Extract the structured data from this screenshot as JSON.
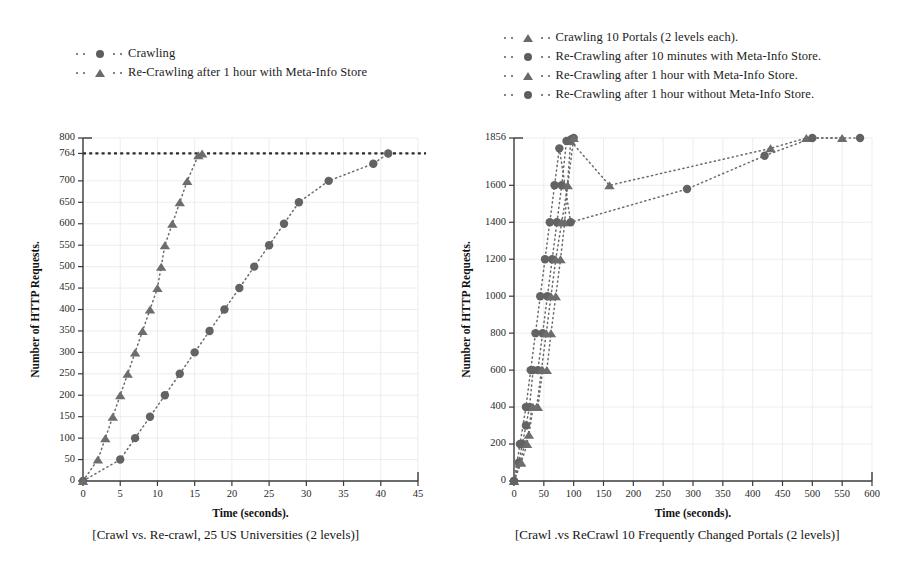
{
  "figure": {
    "panels": [
      {
        "id": "left",
        "caption": "[Crawl vs. Re-crawl, 25 US Universities (2 levels)]",
        "legend": [
          {
            "label": "Crawling",
            "marker": "circle-marker-icon"
          },
          {
            "label": "Re-Crawling after 1 hour with Meta-Info Store",
            "marker": "triangle-marker-icon"
          }
        ]
      },
      {
        "id": "right",
        "caption": "[Crawl .vs ReCrawl 10 Frequently Changed Portals (2 levels)]",
        "legend": [
          {
            "label": "Crawling 10 Portals (2 levels each).",
            "marker": "triangle-marker-icon"
          },
          {
            "label": "Re-Crawling after 10 minutes with Meta-Info Store.",
            "marker": "circle-marker-icon"
          },
          {
            "label": "Re-Crawling after 1 hour with Meta-Info Store.",
            "marker": "triangle-marker-icon"
          },
          {
            "label": "Re-Crawling after 1 hour without Meta-Info Store.",
            "marker": "circle-marker-icon"
          }
        ]
      }
    ]
  },
  "colors": {
    "marker": "#636363",
    "line": "#6b6b6b",
    "axis": "#3a3a3a",
    "reference": "#2b2b2b",
    "grid": "#e9e9e9",
    "text": "#1a1a1a",
    "background": "#ffffff"
  },
  "chart_data": [
    {
      "type": "line",
      "id": "left",
      "title": "[Crawl vs. Re-crawl, 25 US Universities (2 levels)]",
      "xlabel": "Time (seconds).",
      "ylabel": "Number of HTTP Requests.",
      "xlim": [
        0,
        45
      ],
      "ylim": [
        0,
        800
      ],
      "grid": true,
      "legend_position": "above-left",
      "xticks": [
        0,
        5,
        10,
        15,
        20,
        25,
        30,
        35,
        40,
        45
      ],
      "yticks": [
        0,
        50,
        100,
        150,
        200,
        250,
        300,
        350,
        400,
        450,
        500,
        550,
        600,
        650,
        700,
        764,
        800
      ],
      "annotations": [
        {
          "type": "hline",
          "value": 764,
          "label": "764",
          "style": "dotted-thick"
        }
      ],
      "series": [
        {
          "name": "Crawling",
          "marker": "circle",
          "x": [
            0,
            5,
            7,
            9,
            11,
            13,
            15,
            17,
            19,
            21,
            23,
            25,
            27,
            29,
            33,
            39,
            41
          ],
          "y": [
            0,
            50,
            100,
            150,
            200,
            250,
            300,
            350,
            400,
            450,
            500,
            550,
            600,
            650,
            700,
            740,
            764
          ]
        },
        {
          "name": "Re-Crawling after 1 hour with Meta-Info Store",
          "marker": "triangle",
          "x": [
            0,
            2,
            3,
            4,
            5,
            6,
            7,
            8,
            9,
            10,
            10.5,
            11,
            12,
            13,
            14,
            15.5,
            16
          ],
          "y": [
            0,
            50,
            100,
            150,
            200,
            250,
            300,
            350,
            400,
            450,
            500,
            550,
            600,
            650,
            700,
            760,
            764
          ]
        }
      ]
    },
    {
      "type": "line",
      "id": "right",
      "title": "[Crawl .vs ReCrawl 10 Frequently Changed Portals (2 levels)]",
      "xlabel": "Time (seconds).",
      "ylabel": "Number of HTTP Requests.",
      "xlim": [
        0,
        600
      ],
      "ylim": [
        0,
        1856
      ],
      "grid": true,
      "legend_position": "above-left",
      "xticks": [
        0,
        50,
        100,
        150,
        200,
        250,
        300,
        350,
        400,
        450,
        500,
        550,
        600
      ],
      "yticks": [
        0,
        200,
        400,
        600,
        800,
        1000,
        1200,
        1400,
        1600,
        1856
      ],
      "annotations": [],
      "series": [
        {
          "name": "Crawling 10 Portals (2 levels each).",
          "marker": "triangle",
          "x": [
            0,
            10,
            18,
            25,
            32,
            40,
            48,
            55,
            62,
            70,
            78,
            85,
            95,
            160,
            430,
            490,
            550
          ],
          "y": [
            0,
            100,
            200,
            250,
            400,
            400,
            600,
            600,
            800,
            1000,
            1200,
            1400,
            1840,
            1600,
            1800,
            1856,
            1856
          ]
        },
        {
          "name": "Re-Crawling after 10 minutes with Meta-Info Store.",
          "marker": "circle",
          "x": [
            0,
            8,
            14,
            20,
            26,
            32,
            40,
            48,
            56,
            64,
            72,
            80,
            88,
            96,
            100
          ],
          "y": [
            0,
            100,
            200,
            300,
            400,
            600,
            600,
            800,
            1000,
            1200,
            1400,
            1600,
            1840,
            1850,
            1856
          ]
        },
        {
          "name": "Re-Crawling after 1 hour with Meta-Info Store.",
          "marker": "triangle",
          "x": [
            0,
            12,
            22,
            30,
            38,
            46,
            54,
            62,
            70,
            80,
            90,
            100
          ],
          "y": [
            0,
            100,
            200,
            400,
            400,
            600,
            800,
            1000,
            1200,
            1400,
            1600,
            1856
          ]
        },
        {
          "name": "Re-Crawling after 1 hour without Meta-Info Store.",
          "marker": "circle",
          "x": [
            0,
            10,
            20,
            28,
            36,
            44,
            52,
            60,
            68,
            76,
            95,
            290,
            420,
            500,
            580
          ],
          "y": [
            0,
            200,
            400,
            600,
            800,
            1000,
            1200,
            1400,
            1600,
            1800,
            1400,
            1580,
            1760,
            1856,
            1856
          ]
        }
      ]
    }
  ]
}
